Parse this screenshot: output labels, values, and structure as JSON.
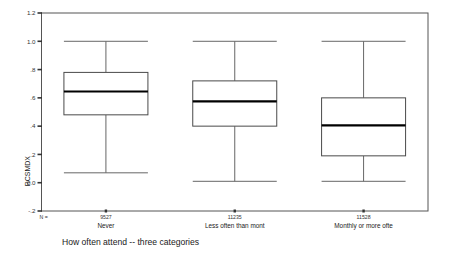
{
  "chart_data": {
    "type": "box",
    "title": "",
    "xlabel": "How often attend -- three categories",
    "ylabel": "RCSMDX",
    "ylim": [
      -0.2,
      1.2
    ],
    "ytick_labels": [
      "1.2",
      "1.0",
      ".8",
      ".6",
      ".4",
      ".2",
      "0.0",
      "-.2"
    ],
    "ytick_values": [
      1.2,
      1.0,
      0.8,
      0.6,
      0.4,
      0.2,
      0.0,
      -0.2
    ],
    "grid": false,
    "legend": "none",
    "n_label": "N =",
    "categories": [
      "Never",
      "Less often than mont",
      "Monthly or more ofte"
    ],
    "n_values": [
      "9527",
      "11235",
      "11528"
    ],
    "boxes": [
      {
        "category": "Never",
        "n": "9527",
        "whisker_low": 0.07,
        "q1": 0.48,
        "median": 0.645,
        "q3": 0.78,
        "whisker_high": 1.0
      },
      {
        "category": "Less often than mont",
        "n": "11235",
        "whisker_low": 0.01,
        "q1": 0.4,
        "median": 0.575,
        "q3": 0.72,
        "whisker_high": 1.0
      },
      {
        "category": "Monthly or more ofte",
        "n": "11528",
        "whisker_low": 0.01,
        "q1": 0.19,
        "median": 0.405,
        "q3": 0.6,
        "whisker_high": 1.0
      }
    ],
    "colors": {
      "box_fill": "#ffffff",
      "box_stroke": "#4a4a4a",
      "median_stroke": "#000000",
      "whisker_stroke": "#666666",
      "frame_stroke": "#555555",
      "text": "#222222",
      "background": "#ffffff"
    }
  }
}
